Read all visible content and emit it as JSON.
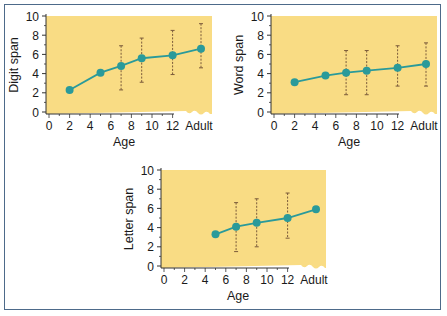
{
  "figure": {
    "frame_color": "#4d6a8a",
    "plot_background": "#f9dc84",
    "line_color": "#2a9a9a",
    "errorbar_color": "#7a5a3a"
  },
  "chart_data": [
    {
      "type": "line",
      "title": "",
      "xlabel": "Age",
      "ylabel": "Digit span",
      "ylim": [
        0,
        10
      ],
      "yticks": [
        "0",
        "2",
        "4",
        "6",
        "8",
        "10"
      ],
      "xticks": [
        "0",
        "2",
        "4",
        "6",
        "8",
        "10",
        "12",
        "Adult"
      ],
      "x": [
        "2",
        "5",
        "7",
        "9",
        "12",
        "Adult"
      ],
      "values": [
        2.3,
        4.1,
        4.8,
        5.6,
        5.9,
        6.6
      ],
      "error_low": [
        null,
        null,
        2.3,
        3.1,
        3.9,
        4.6
      ],
      "error_high": [
        null,
        null,
        6.9,
        7.7,
        8.5,
        9.2
      ],
      "grid": false,
      "legend": "none"
    },
    {
      "type": "line",
      "title": "",
      "xlabel": "Age",
      "ylabel": "Word span",
      "ylim": [
        0,
        10
      ],
      "yticks": [
        "0",
        "2",
        "4",
        "6",
        "8",
        "10"
      ],
      "xticks": [
        "0",
        "2",
        "4",
        "6",
        "8",
        "10",
        "12",
        "Adult"
      ],
      "x": [
        "2",
        "5",
        "7",
        "9",
        "12",
        "Adult"
      ],
      "values": [
        3.1,
        3.8,
        4.1,
        4.3,
        4.6,
        5.0
      ],
      "error_low": [
        null,
        null,
        1.8,
        1.8,
        2.7,
        2.7
      ],
      "error_high": [
        null,
        null,
        6.4,
        6.4,
        6.9,
        7.2
      ],
      "grid": false,
      "legend": "none"
    },
    {
      "type": "line",
      "title": "",
      "xlabel": "Age",
      "ylabel": "Letter span",
      "ylim": [
        0,
        10
      ],
      "yticks": [
        "0",
        "2",
        "4",
        "6",
        "8",
        "10"
      ],
      "xticks": [
        "0",
        "2",
        "4",
        "6",
        "8",
        "10",
        "12",
        "Adult"
      ],
      "x": [
        "5",
        "7",
        "9",
        "12",
        "Adult"
      ],
      "values": [
        3.3,
        4.1,
        4.5,
        5.0,
        5.9
      ],
      "error_low": [
        null,
        1.5,
        2.0,
        2.9,
        null
      ],
      "error_high": [
        null,
        6.6,
        7.0,
        7.6,
        null
      ],
      "grid": false,
      "legend": "none"
    }
  ]
}
